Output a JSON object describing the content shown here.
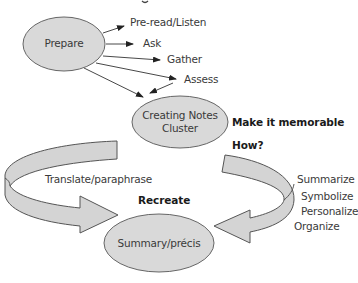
{
  "diagram": {
    "type": "flow",
    "colors": {
      "node_fill": "#d9d9d9",
      "node_stroke": "#666666",
      "arrow_fill": "#d4d4d4",
      "arrow_stroke": "#555555",
      "line": "#333333",
      "text": "#3a3a3a"
    },
    "nodes": {
      "prepare": {
        "label": "Prepare"
      },
      "creating_notes": {
        "line1": "Creating Notes",
        "line2": "Cluster"
      },
      "summary": {
        "label": "Summary/précis"
      }
    },
    "prepare_steps": [
      "Pre-read/Listen",
      "Ask",
      "Gather",
      "Assess"
    ],
    "annotations": {
      "make_memorable": "Make it memorable",
      "how": "How?",
      "recreate": "Recreate",
      "translate": "Translate/paraphrase"
    },
    "how_steps": [
      "Summarize",
      "Symbolize",
      "Personalize",
      "Organize"
    ]
  }
}
